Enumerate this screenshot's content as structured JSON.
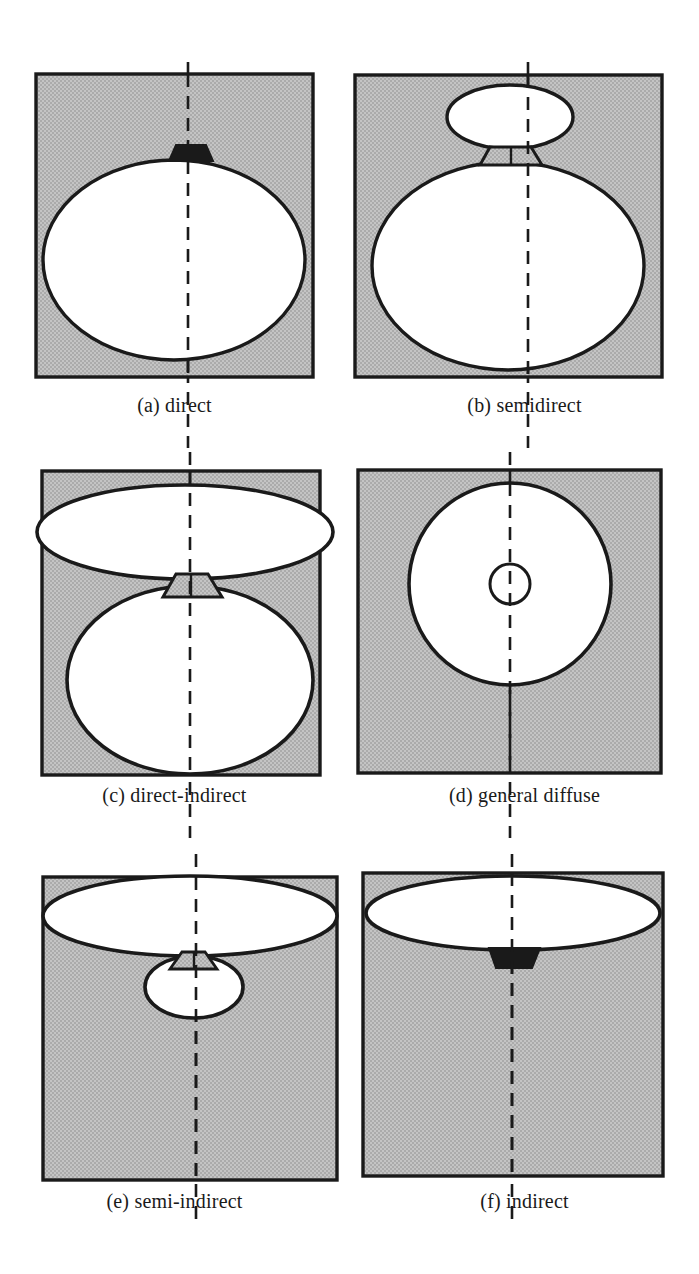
{
  "figure": {
    "columns": 2,
    "rows": 3,
    "colors": {
      "box_fill": "#b9b9b9",
      "box_stroke": "#1a1a1a",
      "luminaire_fill": "#ffffff",
      "luminaire_stroke": "#1a1a1a",
      "shade_fill": "#1a1a1a",
      "axis_stroke": "#1a1a1a",
      "caption_color": "#1a1a1a",
      "background": "#ffffff"
    }
  },
  "panels": [
    {
      "id": "a",
      "label": "(a) direct",
      "letter": "(a)",
      "name": "direct",
      "description": "Large white ellipse filling the lower box with a small black trapezoidal housing on top; light emitted downward only."
    },
    {
      "id": "b",
      "label": "(b) semidirect",
      "letter": "(b)",
      "name": "semidirect",
      "description": "Small upper ellipse joined by a short neck to a large lower ellipse; most light downward, some upward."
    },
    {
      "id": "c",
      "label": "(c) direct-indirect",
      "letter": "(c)",
      "name": "direct-indirect",
      "description": "Wide flat upper ellipse and large round lower ellipse of comparable emission joined by a neck."
    },
    {
      "id": "d",
      "label": "(d) general diffuse",
      "letter": "(d)",
      "name": "general diffuse",
      "description": "Single large white circle with a small circle at its center; light emitted equally in all directions."
    },
    {
      "id": "e",
      "label": "(e) semi-indirect",
      "letter": "(e)",
      "name": "semi-indirect",
      "description": "Large wide upper ellipse with a small lower ellipse joined by a neck; most light upward."
    },
    {
      "id": "f",
      "label": "(f) indirect",
      "letter": "(f)",
      "name": "indirect",
      "description": "Wide flat upper ellipse with a black trapezoidal housing below; all light emitted upward."
    }
  ]
}
